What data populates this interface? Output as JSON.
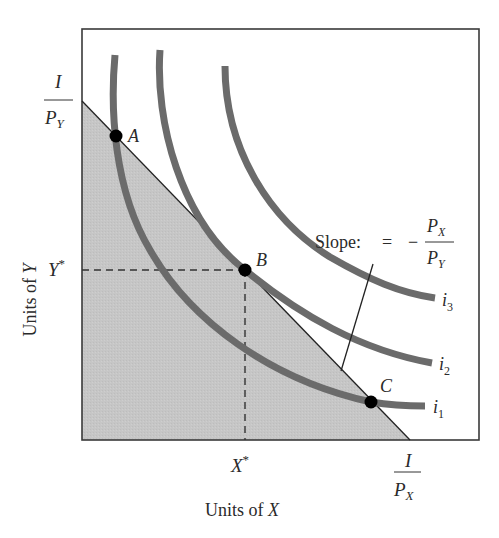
{
  "diagram": {
    "type": "consumer-choice-indifference-curves",
    "x_axis": {
      "label_prefix": "Units of ",
      "label_var": "X"
    },
    "y_axis": {
      "label_prefix": "Units of ",
      "label_var": "Y"
    },
    "budget_line": {
      "y_intercept": {
        "numerator": "I",
        "denom_var": "P",
        "denom_sub": "Y"
      },
      "x_intercept": {
        "numerator": "I",
        "denom_var": "P",
        "denom_sub": "X"
      },
      "slope_label": "Slope:",
      "slope_eq": "=",
      "slope_minus": "−",
      "slope_num_var": "P",
      "slope_num_sub": "X",
      "slope_den_var": "P",
      "slope_den_sub": "Y"
    },
    "optimum": {
      "x_label_var": "X",
      "x_label_sup": "*",
      "y_label_var": "Y",
      "y_label_sup": "*"
    },
    "points": [
      {
        "label": "A"
      },
      {
        "label": "B"
      },
      {
        "label": "C"
      }
    ],
    "curves": [
      {
        "var": "i",
        "sub": "1"
      },
      {
        "var": "i",
        "sub": "2"
      },
      {
        "var": "i",
        "sub": "3"
      }
    ],
    "colors": {
      "feasible_fill": "#c4c4c4",
      "curve": "#6b6b6b",
      "axis": "#333333",
      "point": "#000000"
    }
  }
}
